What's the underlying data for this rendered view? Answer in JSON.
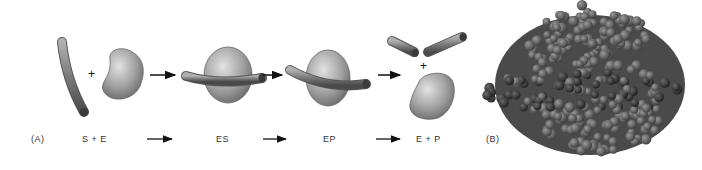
{
  "panel_a": {
    "label": "(A)",
    "steps": [
      {
        "id": "s_plus_e",
        "label": "S  +  E"
      },
      {
        "id": "es",
        "label": "ES"
      },
      {
        "id": "ep",
        "label": "EP"
      },
      {
        "id": "e_plus_p",
        "label": "E + P"
      }
    ],
    "plus_symbols": [
      "+",
      "+"
    ]
  },
  "panel_b": {
    "label": "(B)"
  },
  "colors": {
    "background": "#ffffff",
    "enzyme_fill": "#a8a8a8",
    "substrate_fill": "#7a7a7a",
    "protein_atoms": "#5e5e5e",
    "protein_dark": "#3a3a3a",
    "arrow": "#111111"
  }
}
